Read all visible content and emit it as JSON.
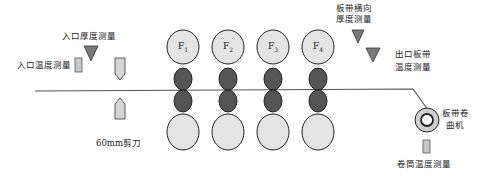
{
  "diagram": {
    "type": "hot-strip-mill-finishing-line",
    "colors": {
      "work_roll_fill": "#e4e4e4",
      "backup_roll_dark": "#555555",
      "sensor_triangle": "#7f7f7f",
      "sensor_rect": "#c8c8c8",
      "strip_line": "#555555",
      "outline": "#222222"
    },
    "labels": {
      "entry_thickness": "入口厚度测量",
      "entry_temperature": "入口温度测量",
      "shear": "60mm剪刀",
      "cross_thickness_line1": "板带横向",
      "cross_thickness_line2": "厚度测量",
      "exit_temp_line1": "出口板带",
      "exit_temp_line2": "温度测量",
      "coiler_line1": "板带卷",
      "coiler_line2": "曲机",
      "coil_temp": "卷筒温度测量"
    },
    "stands": [
      {
        "name": "F",
        "sub": "1"
      },
      {
        "name": "F",
        "sub": "2"
      },
      {
        "name": "F",
        "sub": "3"
      },
      {
        "name": "F",
        "sub": "4"
      }
    ]
  }
}
